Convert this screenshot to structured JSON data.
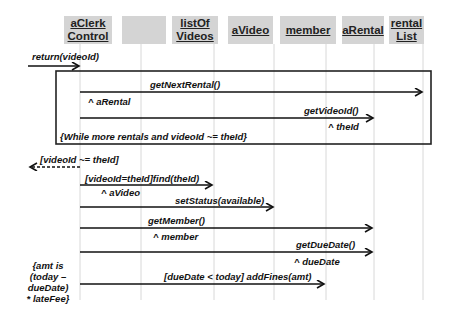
{
  "diagram": {
    "type": "sequence-diagram",
    "participants": [
      {
        "id": "aClerkControl",
        "label": "aClerk\nControl"
      },
      {
        "id": "blank",
        "label": ""
      },
      {
        "id": "listOfVideos",
        "label": "listOf\nVideos"
      },
      {
        "id": "aVideo",
        "label": "aVideo"
      },
      {
        "id": "member",
        "label": "member"
      },
      {
        "id": "aRental",
        "label": "aRental"
      },
      {
        "id": "rentalList",
        "label": "rental\nList"
      }
    ],
    "messages": {
      "return_videoid": "return(videoId)",
      "get_next_rental": "getNextRental()",
      "a_rental_return": "^ aRental",
      "get_video_id": "getVideoId()",
      "the_id_return": "^ theId",
      "loop_guard": "{While more rentals and videoId ~= theId}",
      "videoid_neq": "[videoId ~= theId]",
      "find": "[videoId=theId]find(theId)",
      "a_video_return": "^ aVideo",
      "set_status": "setStatus(available)",
      "get_member": "getMember()",
      "member_return": "^ member",
      "get_due_date": "getDueDate()",
      "due_date_return": "^ dueDate",
      "amt_note": "{amt is\n(today – dueDate)\n* lateFee}",
      "add_fines": "[dueDate < today] addFines(amt)"
    }
  }
}
